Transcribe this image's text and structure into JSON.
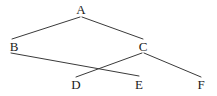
{
  "diagram": {
    "type": "node-link-diagram",
    "width": 217,
    "height": 96,
    "background_color": "#ffffff",
    "edge_color": "#3a3a3a",
    "label_color": "#1a1a1a",
    "edge_width": 1,
    "nodes": [
      {
        "id": "A",
        "label": "A",
        "x": 81,
        "y": 9
      },
      {
        "id": "B",
        "label": "B",
        "x": 14,
        "y": 46
      },
      {
        "id": "C",
        "label": "C",
        "x": 143,
        "y": 46
      },
      {
        "id": "D",
        "label": "D",
        "x": 76,
        "y": 84
      },
      {
        "id": "E",
        "label": "E",
        "x": 139,
        "y": 84
      },
      {
        "id": "F",
        "label": "F",
        "x": 201,
        "y": 84
      }
    ],
    "edges": [
      {
        "id": "edge-a-b",
        "from": "A",
        "to": "B",
        "x1": 80,
        "y1": 17,
        "x2": 12,
        "y2": 39
      },
      {
        "id": "edge-a-c",
        "from": "A",
        "to": "C",
        "x1": 82,
        "y1": 17,
        "x2": 143,
        "y2": 39
      },
      {
        "id": "edge-b-e",
        "from": "B",
        "to": "E",
        "x1": 11,
        "y1": 53,
        "x2": 139,
        "y2": 76
      },
      {
        "id": "edge-c-d",
        "from": "C",
        "to": "D",
        "x1": 142,
        "y1": 53,
        "x2": 76,
        "y2": 77
      },
      {
        "id": "edge-c-f",
        "from": "C",
        "to": "F",
        "x1": 144,
        "y1": 53,
        "x2": 201,
        "y2": 77
      }
    ],
    "crossings": [
      {
        "id": "crossing-be-cd",
        "between": [
          "edge-b-e",
          "edge-c-d"
        ],
        "x": 100,
        "y": 66
      }
    ]
  }
}
